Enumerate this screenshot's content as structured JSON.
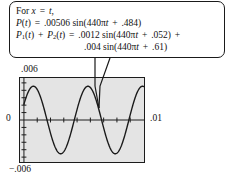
{
  "callout": {
    "lines": [
      {
        "id": "intro",
        "text": "For x = t,"
      },
      {
        "id": "p_of_t",
        "text": "P(t) = .00506 sin(440πt + .484)"
      },
      {
        "id": "p1_plus_p2",
        "text": "P1(t) + P2(t) = .0012 sin(440πt + .052) +"
      },
      {
        "id": "p1_plus_p2_cont",
        "text": ".004 sin(440πt + .61)"
      }
    ],
    "tokens": {
      "for": "For",
      "x": "x",
      "equals": "=",
      "t": "t",
      "comma": ",",
      "P": "P",
      "P1_sub": "1",
      "P2_sub": "2",
      "plus": "+",
      "open": "(",
      "close": ")",
      "amp_P": ".00506",
      "amp_1": ".0012",
      "amp_2": ".004",
      "sin": "sin",
      "freq": "440",
      "pi": "π",
      "phase_P": ".484",
      "phase_1": ".052",
      "phase_2": ".61"
    }
  },
  "axes": {
    "y_max_label": ".006",
    "y_min_label": "−.006",
    "y_zero_label": "0",
    "x_max_label": ".01"
  },
  "chart_data": {
    "type": "line",
    "title": "",
    "xlabel": "",
    "ylabel": "",
    "xlim": [
      0,
      0.01
    ],
    "ylim": [
      -0.006,
      0.006
    ],
    "grid": false,
    "tick_marks": {
      "x_count": 9,
      "y_count": 11
    },
    "legend": null,
    "series": [
      {
        "name": "P(t) = .00506 sin(440πt + .484)",
        "color": "#1a1a1a",
        "amplitude": 0.00506,
        "angular_frequency": 1382.3,
        "phase": 0.484,
        "cycles_shown": 2.2,
        "x": [
          0,
          0.0005,
          0.001,
          0.0015,
          0.002,
          0.0025,
          0.003,
          0.0035,
          0.004,
          0.0045,
          0.005,
          0.0055,
          0.006,
          0.0065,
          0.007,
          0.0075,
          0.008,
          0.0085,
          0.009,
          0.0095,
          0.01
        ],
        "values": [
          0.00236,
          0.00434,
          0.00506,
          0.0043,
          0.00231,
          -0.00031,
          -0.00277,
          -0.00455,
          -0.00505,
          -0.00411,
          -0.00201,
          0.00063,
          0.00304,
          0.00469,
          0.00503,
          0.00395,
          0.00173,
          -0.00092,
          -0.0033,
          -0.00481,
          -0.005
        ]
      }
    ]
  }
}
